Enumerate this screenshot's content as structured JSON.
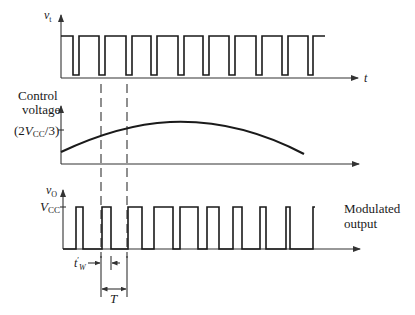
{
  "diagram": {
    "type": "pulse-width-modulation timing diagram",
    "panels": [
      {
        "id": "trigger",
        "y_label": "v",
        "y_label_sub": "t",
        "x_label": "t",
        "description": "Trigger pulse train (narrow negative-going pulses, constant period T)"
      },
      {
        "id": "control",
        "y_label_line1": "Control",
        "y_label_line2": "voltage",
        "tick_label_prefix": "(2",
        "tick_label_v": "V",
        "tick_label_sub": "CC",
        "tick_label_suffix": "/3)",
        "description": "Control voltage rising then falling (modulating signal)"
      },
      {
        "id": "output",
        "y_label": "v",
        "y_label_sub": "O",
        "level_label": "V",
        "level_label_sub": "CC",
        "side_label_line1": "Modulated",
        "side_label_line2": "output",
        "description": "Output pulses whose width follows the control voltage"
      }
    ],
    "annotations": {
      "pulse_width_label": "t",
      "pulse_width_sub": "W",
      "pulse_width_prime": "′",
      "period_label": "T"
    }
  }
}
